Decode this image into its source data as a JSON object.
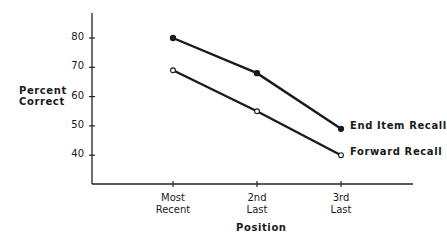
{
  "chart_data": {
    "type": "line",
    "title": "",
    "xlabel": "Position",
    "ylabel": "Percent Correct",
    "ylabel_lines": [
      "Percent",
      "Correct"
    ],
    "categories": [
      "Most Recent",
      "2nd Last",
      "3rd Last"
    ],
    "category_lines": [
      [
        "Most",
        "Recent"
      ],
      [
        "2nd",
        "Last"
      ],
      [
        "3rd",
        "Last"
      ]
    ],
    "yticks": [
      40,
      50,
      60,
      70,
      80
    ],
    "ylim": [
      30,
      88
    ],
    "grid": false,
    "legend_position": "inline-right",
    "series": [
      {
        "name": "End Item Recall",
        "marker": "filled-circle",
        "values": [
          80,
          68,
          49
        ]
      },
      {
        "name": "Forward Recall",
        "marker": "open-circle",
        "values": [
          69,
          55,
          40
        ]
      }
    ]
  }
}
